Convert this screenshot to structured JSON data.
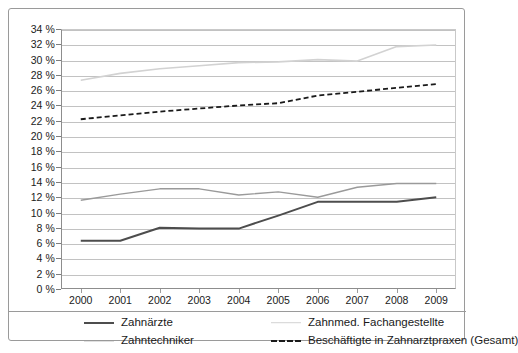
{
  "chart_data": {
    "type": "line",
    "title": "",
    "subtitle": "",
    "xlabel": "",
    "ylabel": "",
    "categories": [
      "2000",
      "2001",
      "2002",
      "2003",
      "2004",
      "2005",
      "2006",
      "2007",
      "2008",
      "2009"
    ],
    "x": [
      2000,
      2001,
      2002,
      2003,
      2004,
      2005,
      2006,
      2007,
      2008,
      2009
    ],
    "ylim": [
      0,
      34
    ],
    "ytick_step": 2,
    "ytick_labels": [
      "0 %",
      "2 %",
      "4 %",
      "6 %",
      "8 %",
      "10 %",
      "12 %",
      "14 %",
      "16 %",
      "18 %",
      "20 %",
      "22 %",
      "24 %",
      "26 %",
      "28 %",
      "30 %",
      "32 %",
      "34 %"
    ],
    "ytick_values": [
      0,
      2,
      4,
      6,
      8,
      10,
      12,
      14,
      16,
      18,
      20,
      22,
      24,
      26,
      28,
      30,
      32,
      34
    ],
    "grid": true,
    "grid_axis": "y",
    "legend_position": "bottom",
    "value_unit": "%",
    "series": [
      {
        "name": "Zahnärzte",
        "color": "#4d4d4d",
        "style": "solid",
        "width": 2.0,
        "values": [
          6.3,
          6.3,
          8.0,
          7.9,
          7.9,
          9.6,
          11.4,
          11.4,
          11.4,
          12.0
        ]
      },
      {
        "name": "Zahntechniker",
        "color": "#9a9a9a",
        "style": "solid",
        "width": 1.4,
        "values": [
          11.6,
          12.4,
          13.1,
          13.1,
          12.3,
          12.7,
          12.0,
          13.3,
          13.8,
          13.8
        ]
      },
      {
        "name": "Zahnmed. Fachangestellte",
        "color": "#d2d2d2",
        "style": "solid",
        "width": 1.6,
        "values": [
          27.3,
          28.2,
          28.8,
          29.2,
          29.6,
          29.7,
          30.0,
          29.8,
          31.7,
          31.9
        ]
      },
      {
        "name": "Beschäftigte in Zahnarztpraxen (Gesamt)",
        "color": "#1a1a1a",
        "style": "dashed",
        "width": 1.8,
        "values": [
          22.2,
          22.7,
          23.2,
          23.6,
          24.0,
          24.3,
          25.3,
          25.8,
          26.3,
          26.8
        ]
      }
    ],
    "legend": [
      {
        "label": "Zahnärzte",
        "color": "#4d4d4d",
        "style": "solid",
        "width": 2.0
      },
      {
        "label": "Zahntechniker",
        "color": "#9a9a9a",
        "style": "solid",
        "width": 1.4
      },
      {
        "label": "Zahnmed. Fachangestellte",
        "color": "#d2d2d2",
        "style": "solid",
        "width": 1.6
      },
      {
        "label": "Beschäftigte in Zahnarztpraxen (Gesamt)",
        "color": "#1a1a1a",
        "style": "dashed",
        "width": 1.8
      }
    ]
  }
}
